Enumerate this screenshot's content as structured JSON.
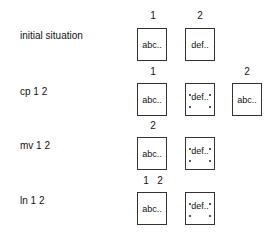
{
  "rows": [
    {
      "label": "initial situation",
      "numbers": [
        "1",
        "2"
      ],
      "boxes": [
        {
          "text": "abc.."
        },
        {
          "text": "def.."
        }
      ]
    },
    {
      "label": "cp 1 2",
      "numbers": [
        "1",
        "2"
      ],
      "boxes": [
        {
          "text": "abc.."
        },
        {
          "text": "def.."
        },
        {
          "text": "abc.."
        }
      ]
    },
    {
      "label": "mv 1 2",
      "numbers": [
        "2"
      ],
      "boxes": [
        {
          "text": "abc.."
        },
        {
          "text": "def.."
        }
      ]
    },
    {
      "label": "ln 1 2",
      "numbers": [
        "1",
        "2"
      ],
      "boxes": [
        {
          "text": "abc.."
        },
        {
          "text": "def.."
        }
      ]
    }
  ]
}
